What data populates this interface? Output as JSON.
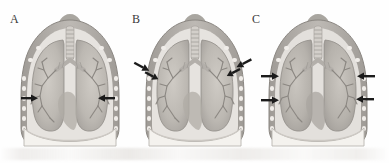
{
  "figure": {
    "type": "medical-illustration",
    "panel_count": 3,
    "background_color": "#fefefe",
    "ink_color": "#6f6f6f",
    "arrow_color": "#1c1c1c"
  },
  "panels": [
    {
      "id": "A",
      "label": "A",
      "label_x": 10,
      "label_y": 12,
      "center_x": 70,
      "arrow_count": 2,
      "arrows": [
        {
          "name": "left-lateral-arrow",
          "x": 21,
          "y": 98,
          "dir": "right",
          "length": 14,
          "angle": 0
        },
        {
          "name": "right-lateral-arrow",
          "x": 112,
          "y": 98,
          "dir": "left",
          "length": 14,
          "angle": 0
        }
      ]
    },
    {
      "id": "B",
      "label": "B",
      "label_x": 132,
      "label_y": 12,
      "center_x": 195,
      "arrow_count": 4,
      "arrows": [
        {
          "name": "left-outer-arrow",
          "x": 137,
          "y": 64,
          "dir": "right",
          "length": 15,
          "angle": 28
        },
        {
          "name": "left-inner-arrow",
          "x": 147,
          "y": 73,
          "dir": "right",
          "length": 14,
          "angle": 28
        },
        {
          "name": "right-inner-arrow",
          "x": 223,
          "y": 73,
          "dir": "left",
          "length": 14,
          "angle": -28
        },
        {
          "name": "right-outer-arrow",
          "x": 246,
          "y": 62,
          "dir": "left",
          "length": 15,
          "angle": -28
        }
      ]
    },
    {
      "id": "C",
      "label": "C",
      "label_x": 249,
      "label_y": 12,
      "center_x": 318,
      "arrow_count": 4,
      "arrows": [
        {
          "name": "left-upper-arrow",
          "x": 261,
          "y": 76,
          "dir": "right",
          "length": 16,
          "angle": 0
        },
        {
          "name": "left-lower-arrow",
          "x": 261,
          "y": 100,
          "dir": "right",
          "length": 16,
          "angle": 0
        },
        {
          "name": "right-upper-arrow",
          "x": 357,
          "y": 76,
          "dir": "left",
          "length": 16,
          "angle": 0
        },
        {
          "name": "right-lower-arrow",
          "x": 356,
          "y": 99,
          "dir": "left",
          "length": 16,
          "angle": 0
        }
      ]
    }
  ],
  "anatomy": {
    "structures": [
      "neck",
      "trachea",
      "carina",
      "main-bronchi",
      "bronchial-tree",
      "right-lung",
      "left-lung",
      "rib-cage",
      "pleural-space",
      "heart-silhouette",
      "diaphragm"
    ],
    "colors": {
      "lung_fill": "#b7b3ad",
      "lung_fill_light": "#c9c5bf",
      "chest_wall": "#a9a5a0",
      "rib_marker": "#efece8",
      "trachea": "#cfcbc6",
      "diaphragm": "#f2f0ec",
      "bronchus_line": "#8d8984",
      "neck_shadow": "#98948f"
    }
  }
}
